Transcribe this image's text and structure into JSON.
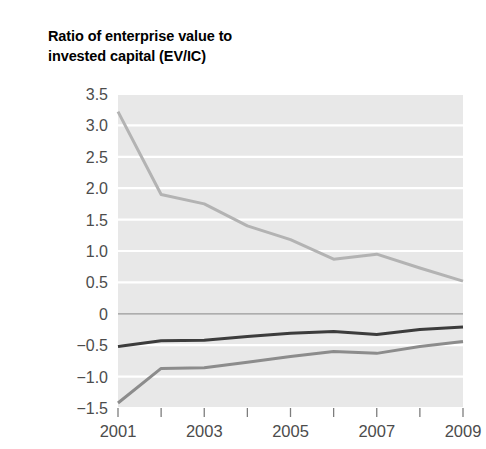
{
  "chart_data": {
    "type": "line",
    "title": "Ratio of enterprise value to\ninvested capital (EV/IC)",
    "title_line1": "Ratio of enterprise value to",
    "title_line2": "invested capital (EV/IC)",
    "xlabel": "",
    "ylabel": "",
    "x": [
      2001,
      2002,
      2003,
      2004,
      2005,
      2006,
      2007,
      2008,
      2009
    ],
    "xlim": [
      2001,
      2009
    ],
    "ylim": [
      -1.5,
      3.5
    ],
    "grid": true,
    "grid_axis": "y",
    "legend": "none",
    "plot_background": "#e8e8e8",
    "gridline_color": "#ffffff",
    "zero_line_color": "#9a9a9a",
    "xtick_positions": [
      2001,
      2002,
      2003,
      2004,
      2005,
      2006,
      2007,
      2008,
      2009
    ],
    "xtick_labels": [
      "2001",
      "",
      "2003",
      "",
      "2005",
      "",
      "2007",
      "",
      "2009"
    ],
    "xtick_labels_shown": [
      "2001",
      "2003",
      "2005",
      "2007",
      "2009"
    ],
    "ytick_values": [
      3.5,
      3.0,
      2.5,
      2.0,
      1.5,
      1.0,
      0.5,
      0,
      -0.5,
      -1.0,
      -1.5
    ],
    "ytick_labels": [
      "3.5",
      "3.0",
      "2.5",
      "2.0",
      "1.5",
      "1.0",
      "0.5",
      "0",
      "−0.5",
      "−1.0",
      "−1.5"
    ],
    "series": [
      {
        "name": "series-light-gray",
        "color": "#b3b3b3",
        "linewidth": 3.0,
        "values": [
          3.22,
          1.9,
          1.75,
          1.4,
          1.18,
          0.87,
          0.95,
          0.73,
          0.52
        ]
      },
      {
        "name": "series-dark",
        "color": "#3c3c3c",
        "linewidth": 3.0,
        "values": [
          -0.52,
          -0.43,
          -0.42,
          -0.36,
          -0.31,
          -0.28,
          -0.33,
          -0.25,
          -0.21
        ]
      },
      {
        "name": "series-medium-gray",
        "color": "#8c8c8c",
        "linewidth": 3.0,
        "values": [
          -1.42,
          -0.87,
          -0.86,
          -0.77,
          -0.68,
          -0.6,
          -0.63,
          -0.52,
          -0.44
        ]
      }
    ]
  }
}
